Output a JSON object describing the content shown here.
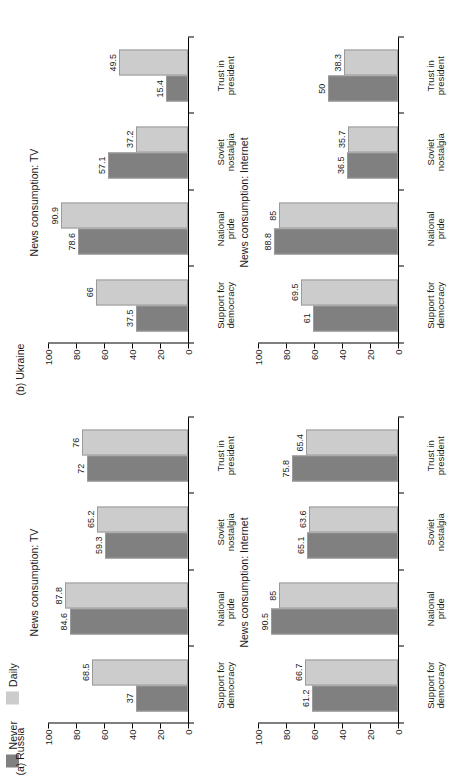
{
  "figure": {
    "legend": {
      "items": [
        {
          "label": "Never",
          "color": "#808080"
        },
        {
          "label": "Daily",
          "color": "#cccccc"
        }
      ]
    },
    "panel_labels": {
      "a": "(a) Russia",
      "b": "(b) Ukraine"
    },
    "y_ticks": [
      "100",
      "80",
      "60",
      "40",
      "20",
      "0"
    ],
    "categories": [
      "Support for democracy",
      "National pride",
      "Soviet nostalgia",
      "Trust in president"
    ],
    "category_lines": [
      [
        "Support for",
        "democracy"
      ],
      [
        "National",
        "pride"
      ],
      [
        "Soviet",
        "nostalgia"
      ],
      [
        "Trust in",
        "president"
      ]
    ]
  },
  "chart_data": [
    {
      "type": "bar",
      "panel": "(a) Russia",
      "title": "News consumption: TV",
      "categories": [
        "Support for democracy",
        "National pride",
        "Soviet nostalgia",
        "Trust in president"
      ],
      "series": [
        {
          "name": "Never",
          "color": "#808080",
          "values": [
            37,
            84.6,
            59.3,
            72
          ]
        },
        {
          "name": "Daily",
          "color": "#cccccc",
          "values": [
            68.5,
            87.8,
            65.2,
            76
          ]
        }
      ],
      "xlabel": "",
      "ylabel": "",
      "ylim": [
        0,
        100
      ],
      "yticks": [
        0,
        20,
        40,
        60,
        80,
        100
      ],
      "grid": false,
      "legend_position": "top-left"
    },
    {
      "type": "bar",
      "panel": "(a) Russia",
      "title": "News consumption: Internet",
      "categories": [
        "Support for democracy",
        "National pride",
        "Soviet nostalgia",
        "Trust in president"
      ],
      "series": [
        {
          "name": "Never",
          "color": "#808080",
          "values": [
            61.2,
            90.5,
            65.1,
            75.8
          ]
        },
        {
          "name": "Daily",
          "color": "#cccccc",
          "values": [
            66.7,
            85,
            63.6,
            65.4
          ]
        }
      ],
      "xlabel": "",
      "ylabel": "",
      "ylim": [
        0,
        100
      ],
      "yticks": [
        0,
        20,
        40,
        60,
        80,
        100
      ],
      "grid": false,
      "legend_position": "none"
    },
    {
      "type": "bar",
      "panel": "(b) Ukraine",
      "title": "News consumption: TV",
      "categories": [
        "Support for democracy",
        "National pride",
        "Soviet nostalgia",
        "Trust in president"
      ],
      "series": [
        {
          "name": "Never",
          "color": "#808080",
          "values": [
            37.5,
            78.6,
            57.1,
            15.4
          ]
        },
        {
          "name": "Daily",
          "color": "#cccccc",
          "values": [
            66,
            90.9,
            37.2,
            49.5
          ]
        }
      ],
      "xlabel": "",
      "ylabel": "",
      "ylim": [
        0,
        100
      ],
      "yticks": [
        0,
        20,
        40,
        60,
        80,
        100
      ],
      "grid": false,
      "legend_position": "none"
    },
    {
      "type": "bar",
      "panel": "(b) Ukraine",
      "title": "News consumption: Internet",
      "categories": [
        "Support for democracy",
        "National pride",
        "Soviet nostalgia",
        "Trust in president"
      ],
      "series": [
        {
          "name": "Never",
          "color": "#808080",
          "values": [
            61,
            88.8,
            36.5,
            50
          ]
        },
        {
          "name": "Daily",
          "color": "#cccccc",
          "values": [
            69.5,
            85,
            35.7,
            38.3
          ]
        }
      ],
      "xlabel": "",
      "ylabel": "",
      "ylim": [
        0,
        100
      ],
      "yticks": [
        0,
        20,
        40,
        60,
        80,
        100
      ],
      "grid": false,
      "legend_position": "none"
    }
  ]
}
